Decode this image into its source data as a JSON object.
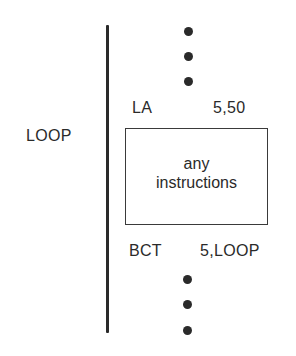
{
  "diagram": {
    "label": "LOOP",
    "top_instruction": {
      "opcode": "LA",
      "operands": "5,50"
    },
    "body_box": {
      "line1": "any",
      "line2": "instructions"
    },
    "bottom_instruction": {
      "opcode": "BCT",
      "operands": "5,LOOP"
    },
    "ellipsis_dots_top": 3,
    "ellipsis_dots_bottom": 3
  }
}
